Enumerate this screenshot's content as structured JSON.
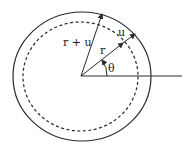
{
  "diagram": {
    "labels": {
      "r_plus_u": "r + u",
      "r": "r",
      "u": "u",
      "theta": "θ"
    },
    "colors": {
      "stroke": "#2a2a2a",
      "background": "#ffffff"
    }
  }
}
